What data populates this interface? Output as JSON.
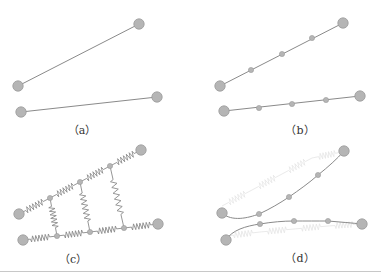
{
  "colors": {
    "line": "#8a8a8a",
    "node_fill": "#b5b5b5",
    "node_stroke": "#9a9a9a",
    "ghost": "#e4e4e4",
    "rule": "#c8c8c8"
  },
  "panels": [
    {
      "id": "a",
      "label": "（a）",
      "label_pos": [
        82,
        122
      ],
      "chains": [
        {
          "nodes": [
            [
              18,
              86
            ],
            [
              139,
              24
            ]
          ],
          "small": []
        },
        {
          "nodes": [
            [
              21,
              112
            ],
            [
              157,
              97
            ]
          ],
          "small": []
        }
      ]
    },
    {
      "id": "b",
      "label": "（b）",
      "label_pos": [
        300,
        122
      ],
      "chains": [
        {
          "nodes": [
            [
              220,
              86
            ],
            [
              251,
              70
            ],
            [
              282,
              54
            ],
            [
              312,
              38
            ],
            [
              343,
              23
            ]
          ],
          "small": [
            1,
            2,
            3
          ]
        },
        {
          "nodes": [
            [
              224,
              111
            ],
            [
              259,
              108
            ],
            [
              292,
              104
            ],
            [
              326,
              100
            ],
            [
              360,
              96
            ]
          ],
          "small": [
            1,
            2,
            3
          ]
        }
      ]
    },
    {
      "id": "c",
      "label": "（c）",
      "label_pos": [
        73,
        251
      ],
      "chains": [
        {
          "nodes": [
            [
              19,
              214
            ],
            [
              50,
              198
            ],
            [
              80,
              182
            ],
            [
              110,
              166
            ],
            [
              141,
              150
            ]
          ],
          "small": [
            1,
            2,
            3
          ]
        },
        {
          "nodes": [
            [
              23,
              240
            ],
            [
              57,
              236
            ],
            [
              90,
              232
            ],
            [
              124,
              228
            ],
            [
              158,
              224
            ]
          ],
          "small": [
            1,
            2,
            3
          ]
        }
      ],
      "cross_springs": [
        [
          [
            50,
            198
          ],
          [
            57,
            236
          ]
        ],
        [
          [
            80,
            182
          ],
          [
            90,
            232
          ]
        ],
        [
          [
            110,
            166
          ],
          [
            124,
            228
          ]
        ]
      ]
    },
    {
      "id": "d",
      "label": "（d）",
      "label_pos": [
        300,
        250
      ],
      "curves": [
        {
          "path": "M222,213 C232,222 248,218 259,214 C270,209 280,203 289,197 C299,190 309,183 318,175 C328,167 337,159 344,151",
          "big": [
            [
              222,
              213
            ],
            [
              344,
              151
            ]
          ],
          "small": [
            [
              259,
              214
            ],
            [
              289,
              197
            ],
            [
              318,
              175
            ]
          ]
        },
        {
          "path": "M226,240 C232,230 246,226 260,224 C272,222 283,221 294,221 C306,221 317,221 328,221 C340,222 352,223 362,224",
          "big": [
            [
              226,
              240
            ],
            [
              362,
              224
            ]
          ],
          "small": [
            [
              260,
              224
            ],
            [
              294,
              221
            ],
            [
              328,
              221
            ]
          ]
        }
      ],
      "ghost_chains": [
        {
          "nodes": [
            [
              222,
              206
            ],
            [
              252,
              190
            ],
            [
              282,
              174
            ],
            [
              312,
              158
            ],
            [
              342,
              152
            ]
          ]
        },
        {
          "nodes": [
            [
              226,
              236
            ],
            [
              260,
              232
            ],
            [
              294,
              229
            ],
            [
              328,
              226
            ],
            [
              360,
              224
            ]
          ]
        }
      ]
    }
  ]
}
